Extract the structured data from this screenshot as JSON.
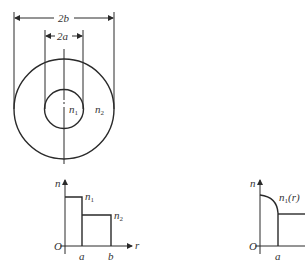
{
  "figure": {
    "cross_section": {
      "outer_dimension_label": "2b",
      "inner_dimension_label": "2a",
      "core_index_label": {
        "base": "n",
        "sub": "1"
      },
      "cladding_index_label": {
        "base": "n",
        "sub": "2"
      }
    },
    "step_index_profile": {
      "y_axis_label": "n",
      "x_axis_label": "r",
      "origin_label": "O",
      "tick_a_label": "a",
      "tick_b_label": "b",
      "core_level_label": {
        "base": "n",
        "sub": "1"
      },
      "cladding_level_label": {
        "base": "n",
        "sub": "2"
      }
    },
    "graded_index_profile": {
      "y_axis_label": "n",
      "origin_label": "O",
      "tick_a_label": "a",
      "core_curve_label": {
        "base": "n",
        "sub": "1",
        "suffix": "(r)"
      }
    }
  }
}
